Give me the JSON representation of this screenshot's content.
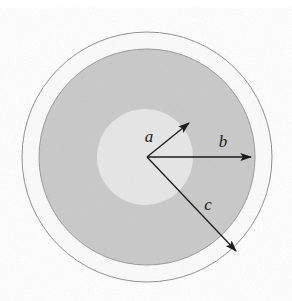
{
  "figure": {
    "type": "geometric-diagram",
    "canvas": {
      "width": 292,
      "height": 301,
      "background": "#ffffff"
    },
    "center": {
      "x": 147,
      "y": 157
    },
    "regions": [
      {
        "name": "outer-shell-ring",
        "shape": "circle",
        "radius": 125,
        "fill": "#fbfbfb",
        "stroke": "#8d8d8d",
        "stroke_width": 1,
        "description": "outermost circle boundary at radius c"
      },
      {
        "name": "middle-shaded-disk",
        "shape": "circle",
        "radius": 108,
        "fill": "#c9c9c9",
        "stroke": "#9a9a9a",
        "stroke_width": 1,
        "description": "medium grey shaded disk boundary at radius b"
      },
      {
        "name": "inner-light-disk",
        "shape": "circle",
        "radius": 48,
        "offset_x": -2,
        "offset_y": 0,
        "fill": "#e6e6e6",
        "stroke": "none",
        "stroke_width": 0,
        "description": "light grey inner disk of radius a"
      }
    ],
    "arrows": [
      {
        "name": "radius-arrow-a",
        "label": "a",
        "label_x": 149,
        "label_y": 138,
        "angle_deg": 36,
        "length": 52,
        "tip_x": 189,
        "tip_y": 123,
        "color": "#1c1c1c",
        "stroke_width": 1.3
      },
      {
        "name": "radius-arrow-b",
        "label": "b",
        "label_x": 223,
        "label_y": 143,
        "angle_deg": 0,
        "length": 104,
        "tip_x": 251,
        "tip_y": 157,
        "color": "#1c1c1c",
        "stroke_width": 1.3
      },
      {
        "name": "radius-arrow-c",
        "label": "c",
        "label_x": 208,
        "label_y": 206,
        "angle_deg": -48,
        "length": 131,
        "tip_x": 236,
        "tip_y": 251,
        "color": "#1c1c1c",
        "stroke_width": 1.3
      }
    ],
    "labels": {
      "a": "a",
      "b": "b",
      "c": "c"
    }
  }
}
